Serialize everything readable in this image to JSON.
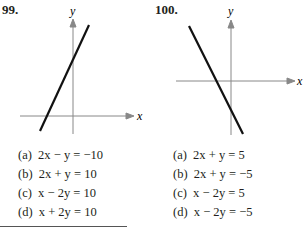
{
  "problems": [
    {
      "number": "99.",
      "axis_labels": {
        "x": "x",
        "y": "y"
      },
      "options": [
        "(a)  2x − y = −10",
        "(b)  2x + y = 10",
        "(c)  x − 2y = 10",
        "(d)  x + 2y = 10"
      ]
    },
    {
      "number": "100.",
      "axis_labels": {
        "x": "x",
        "y": "y"
      },
      "options": [
        "(a)  2x + y = 5",
        "(b)  2x + y = −5",
        "(c)  x − 2y = 5",
        "(d)  x − 2y = −5"
      ]
    }
  ]
}
